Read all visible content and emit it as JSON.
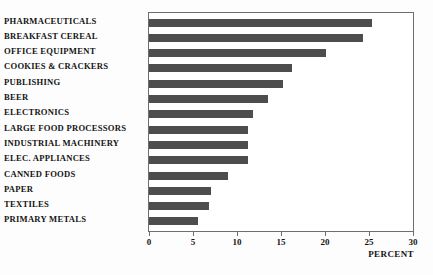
{
  "chart_data": {
    "type": "bar",
    "orientation": "horizontal",
    "title": "",
    "subtitle": "",
    "xlabel": "PERCENT",
    "ylabel": "",
    "xlim": [
      0,
      30
    ],
    "xticks": [
      0,
      5,
      10,
      15,
      20,
      25,
      30
    ],
    "xtick_labels": [
      "0",
      "5",
      "10",
      "15",
      "20",
      "25",
      "30"
    ],
    "grid": false,
    "legend": null,
    "bar_color": "#4d4d4d",
    "frame_color": "#6e6e6e",
    "categories": [
      "PHARMACEUTICALS",
      "BREAKFAST CEREAL",
      "OFFICE EQUIPMENT",
      "COOKIES & CRACKERS",
      "PUBLISHING",
      "BEER",
      "ELECTRONICS",
      "LARGE FOOD PROCESSORS",
      "INDUSTRIAL MACHINERY",
      "ELEC. APPLIANCES",
      "CANNED FOODS",
      "PAPER",
      "TEXTILES",
      "PRIMARY METALS"
    ],
    "values": [
      25.3,
      24.3,
      20.1,
      16.3,
      15.2,
      13.5,
      11.8,
      11.3,
      11.3,
      11.3,
      9.0,
      7.0,
      6.8,
      5.6
    ]
  }
}
